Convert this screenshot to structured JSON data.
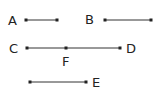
{
  "diagram": {
    "stroke_color": "#333333",
    "segments": [
      {
        "id": "AB-left",
        "label": "A",
        "x1": 26,
        "x2": 57,
        "y": 20
      },
      {
        "id": "B-seg",
        "label": "B",
        "x1": 105,
        "x2": 151,
        "y": 20
      },
      {
        "id": "CD",
        "label_start": "C",
        "label_end": "D",
        "label_mid": "F",
        "x1": 27,
        "x2": 120,
        "xm": 66,
        "y": 48
      },
      {
        "id": "E-seg",
        "label": "E",
        "x1": 30,
        "x2": 86,
        "y": 82
      }
    ],
    "labels": {
      "a": "A",
      "b": "B",
      "c": "C",
      "d": "D",
      "e": "E",
      "f": "F"
    }
  }
}
